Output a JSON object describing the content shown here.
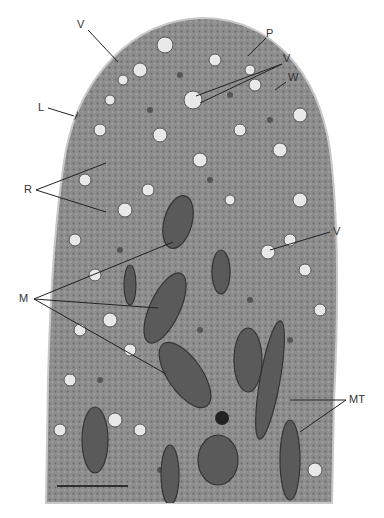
{
  "figure": {
    "type": "transmission electron micrograph",
    "background_color": "#ffffff",
    "cytoplasm_color": "#8f8f8f",
    "organelle_color": "#4a4a4a",
    "vesicle_color": "#e6e6e6"
  },
  "labels": [
    {
      "id": "v-top-left",
      "text": "V",
      "x": 81,
      "y": 20,
      "target": [
        118,
        62
      ]
    },
    {
      "id": "p",
      "text": "P",
      "x": 267,
      "y": 35,
      "target": [
        248,
        56
      ]
    },
    {
      "id": "v-top-right",
      "text": "V",
      "x": 285,
      "y": 58,
      "target1": [
        196,
        96
      ],
      "target2": [
        200,
        103
      ]
    },
    {
      "id": "w",
      "text": "W",
      "x": 288,
      "y": 76,
      "target": [
        275,
        90
      ]
    },
    {
      "id": "l",
      "text": "L",
      "x": 38,
      "y": 103,
      "target": [
        74,
        116
      ]
    },
    {
      "id": "r",
      "text": "R",
      "x": 25,
      "y": 183,
      "target1": [
        106,
        163
      ],
      "target2": [
        106,
        212
      ]
    },
    {
      "id": "v-mid-right",
      "text": "V",
      "x": 333,
      "y": 228,
      "target": [
        270,
        250
      ]
    },
    {
      "id": "m",
      "text": "M",
      "x": 20,
      "y": 294,
      "target1": [
        173,
        242
      ],
      "target2": [
        158,
        308
      ],
      "target3": [
        166,
        374
      ]
    },
    {
      "id": "mt",
      "text": "MT",
      "x": 351,
      "y": 395,
      "target1": [
        290,
        400
      ],
      "target2": [
        300,
        432
      ]
    }
  ],
  "scale_bar": {
    "x1": 57,
    "x2": 128,
    "y": 486
  }
}
